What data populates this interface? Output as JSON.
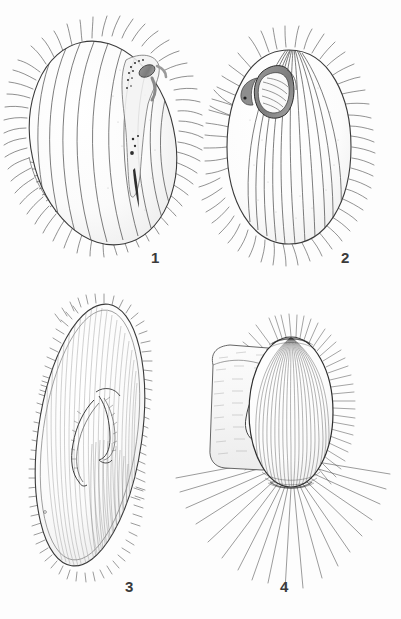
{
  "plate": {
    "kind": "scientific-illustration-plate",
    "medium": "pen-and-ink line drawing",
    "subject": "ciliate protozoa morphology",
    "background_color": "#fdfdfd",
    "ink_color": "#3a3a3a",
    "shade_color": "#8a8a8a",
    "dark_shade_color": "#6a6a6a",
    "width": 401,
    "height": 619
  },
  "figures": [
    {
      "id": "figure-1",
      "label": "1",
      "label_x": 151,
      "label_y": 249,
      "caption_text": "1",
      "description": "Ovoid ciliate seen from the left, body covered with longitudinal meridional ridges, a marginal fringe of cilia all round, a ladder-like membranelle band along the lower-left margin, and an elongate oral groove with granules at the anterior right",
      "body": {
        "center_x": 103,
        "center_y": 143,
        "radius_x": 72,
        "radius_y": 103,
        "rotation_deg": -12
      },
      "ridge_count": 9,
      "cilia_count": 58,
      "has_membranelle_ladder": true,
      "oral_groove": true
    },
    {
      "id": "figure-2",
      "label": "2",
      "label_x": 341,
      "label_y": 249,
      "caption_text": "2",
      "description": "Pear-shaped ciliate seen from the front, with straight longitudinal ridges converging at the anterior, a dense fringe of cilia, and a shaded funnel-shaped oral opening near the anterior left",
      "body": {
        "center_x": 289,
        "center_y": 147,
        "radius_x": 62,
        "radius_y": 97,
        "rotation_deg": 0
      },
      "ridge_count": 11,
      "cilia_count": 64,
      "has_membranelle_ladder": false,
      "oral_groove": true
    },
    {
      "id": "figure-3",
      "label": "3",
      "label_x": 125,
      "label_y": 578,
      "caption_text": "3",
      "description": "Elongate slipper-shaped ciliate with a dense even fringe of short cilia along the whole margin, fine longitudinal striation over the body, and a curved hook-like oral apparatus in the middle of the right side",
      "body": {
        "center_x": 90,
        "center_y": 435,
        "radius_x": 52,
        "radius_y": 132,
        "rotation_deg": 8
      },
      "ridge_count": 0,
      "cilia_count": 110,
      "has_membranelle_ladder": false,
      "oral_groove": true
    },
    {
      "id": "figure-4",
      "label": "4",
      "label_x": 280,
      "label_y": 578,
      "caption_text": "4",
      "description": "Oblique view of a ciliate: an ovoid striated body with long straight radiating cilia spreading outward, overlapping a broad stippled cylindrical structure behind it to the left",
      "body": {
        "center_x": 291,
        "center_y": 412,
        "radius_x": 42,
        "radius_y": 75,
        "rotation_deg": 0
      },
      "ridge_count": 26,
      "cilia_count": 70,
      "has_membranelle_ladder": false,
      "oral_groove": false
    }
  ],
  "labels": {
    "figure_1": "1",
    "figure_2": "2",
    "figure_3": "3",
    "figure_4": "4"
  }
}
